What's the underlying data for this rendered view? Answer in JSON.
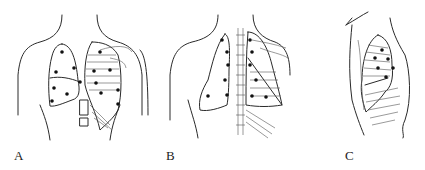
{
  "figure": {
    "panels": [
      {
        "id": "A",
        "label": "A",
        "view": "anterior chest",
        "points": 13
      },
      {
        "id": "B",
        "label": "B",
        "view": "posterior chest",
        "points": 12
      },
      {
        "id": "C",
        "label": "C",
        "view": "lateral chest",
        "points": 6
      }
    ],
    "colors": {
      "line": "#2a2a2a",
      "dot": "#111111",
      "background": "#ffffff"
    }
  }
}
